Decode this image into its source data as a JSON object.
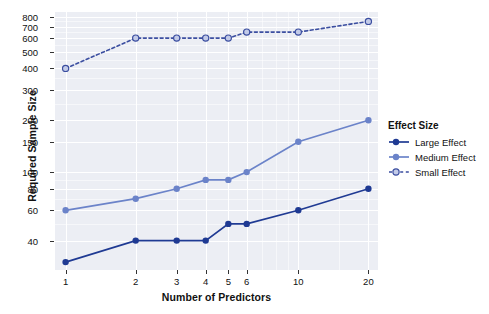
{
  "chart_data": {
    "type": "line",
    "title": "",
    "xlabel": "Number of Predictors",
    "ylabel": "Required Sample Size",
    "x_scale": "log",
    "y_scale": "log",
    "grid": true,
    "legend_position": "right",
    "legend_title": "Effect Size",
    "x": [
      1,
      2,
      3,
      4,
      5,
      6,
      10,
      20
    ],
    "xticks": [
      "1",
      "2",
      "3",
      "4",
      "5",
      "6",
      "10",
      "20"
    ],
    "yticks": [
      "40",
      "60",
      "80",
      "100",
      "150",
      "200",
      "300",
      "400",
      "500",
      "600",
      "700",
      "800"
    ],
    "xlim": [
      0.9,
      22
    ],
    "ylim": [
      27,
      850
    ],
    "series": [
      {
        "name": "Large Effect",
        "color": "#1f3a93",
        "style": "solid",
        "marker": "filled-circle",
        "values": [
          30,
          40,
          40,
          40,
          50,
          50,
          60,
          80
        ]
      },
      {
        "name": "Medium Effect",
        "color": "#6b83c9",
        "style": "solid",
        "marker": "filled-circle",
        "values": [
          60,
          70,
          80,
          90,
          90,
          100,
          150,
          200
        ]
      },
      {
        "name": "Small Effect",
        "color": "#3b4ea0",
        "style": "dotted",
        "marker": "open-circle",
        "values": [
          400,
          600,
          600,
          600,
          600,
          650,
          650,
          750
        ]
      }
    ]
  },
  "panel": {
    "background": "#eceef4",
    "gridline_color": "#ffffff"
  }
}
